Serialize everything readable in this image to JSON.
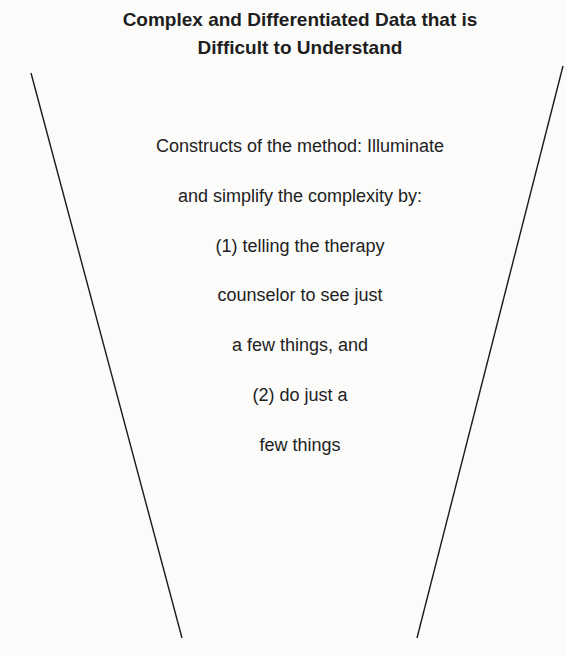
{
  "diagram": {
    "title": {
      "line1": "Complex and Differentiated Data that is",
      "line2": "Difficult to Understand"
    },
    "funnel": {
      "shape": "inverted-trapezoid-open",
      "line_color": "#1a1a1a",
      "left_line": {
        "x1": 31,
        "y1": 73,
        "x2": 182,
        "y2": 638
      },
      "right_line": {
        "x1": 563,
        "y1": 66,
        "x2": 417,
        "y2": 638
      }
    },
    "body_lines": [
      "Constructs of the method: Illuminate",
      "and simplify the complexity by:",
      "(1) telling the therapy",
      "counselor to see just",
      "a few things, and",
      "(2) do just a",
      "few things"
    ]
  }
}
